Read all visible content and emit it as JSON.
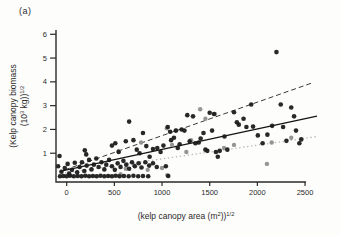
{
  "panel_label": "(a)",
  "chart_data": {
    "type": "scatter",
    "title": "",
    "xlabel_text": "(kelp canopy area (m²))¹⁄²",
    "ylabel_text": "(Kelp canopy biomass (10³ kg))¹⁄²",
    "xlabel_parts": [
      {
        "t": "(kelp canopy area (m"
      },
      {
        "t": "2",
        "sup": true
      },
      {
        "t": "))"
      },
      {
        "t": "1/2",
        "sup": true
      }
    ],
    "ylabel_line1": "(Kelp canopy biomass",
    "ylabel_line2_parts": [
      {
        "t": "(10"
      },
      {
        "t": "3",
        "sup": true
      },
      {
        "t": " kg))"
      },
      {
        "t": "1/2",
        "sup": true
      }
    ],
    "xlim": [
      -112,
      2510
    ],
    "ylim": [
      -0.21,
      6.18
    ],
    "xticks": [
      0,
      500,
      1000,
      1500,
      2000,
      2500
    ],
    "yticks": [
      1,
      2,
      3,
      4,
      5,
      6
    ],
    "grid": false,
    "legend": "none",
    "colors": {
      "dark_points": "#1b1b1b",
      "gray_points": "#8f8f8f",
      "dashed_line": "#3a3a3a",
      "solid_line": "#141414",
      "dotted_line": "#b8b8b8",
      "axis": "#2b2b2b"
    },
    "lines": [
      {
        "name": "dashed-regression",
        "style": "dashed",
        "x1": -20,
        "y1": 0.3,
        "x2": 2570,
        "y2": 3.95
      },
      {
        "name": "solid-regression",
        "style": "solid",
        "x1": -60,
        "y1": 0.25,
        "x2": 2625,
        "y2": 2.56
      },
      {
        "name": "dotted-regression",
        "style": "dotted",
        "x1": -60,
        "y1": 0.15,
        "x2": 2625,
        "y2": 1.7
      }
    ],
    "series": [
      {
        "name": "dark-points",
        "points": [
          [
            -70,
            0.03
          ],
          [
            -35,
            0.04
          ],
          [
            0,
            0.03
          ],
          [
            35,
            0.05
          ],
          [
            75,
            0.03
          ],
          [
            115,
            0.04
          ],
          [
            155,
            0.03
          ],
          [
            195,
            0.05
          ],
          [
            235,
            0.03
          ],
          [
            275,
            0.04
          ],
          [
            315,
            0.03
          ],
          [
            355,
            0.05
          ],
          [
            395,
            0.03
          ],
          [
            435,
            0.04
          ],
          [
            475,
            0.03
          ],
          [
            515,
            0.05
          ],
          [
            555,
            0.03
          ],
          [
            600,
            0.04
          ],
          [
            650,
            0.03
          ],
          [
            700,
            0.05
          ],
          [
            750,
            0.03
          ],
          [
            800,
            0.04
          ],
          [
            855,
            0.03
          ],
          [
            1065,
            0.04
          ],
          [
            -90,
            0.45
          ],
          [
            -55,
            0.22
          ],
          [
            -20,
            0.38
          ],
          [
            10,
            0.55
          ],
          [
            25,
            0.15
          ],
          [
            55,
            0.3
          ],
          [
            85,
            0.6
          ],
          [
            110,
            0.2
          ],
          [
            135,
            0.42
          ],
          [
            160,
            0.62
          ],
          [
            185,
            0.25
          ],
          [
            210,
            0.48
          ],
          [
            235,
            0.72
          ],
          [
            260,
            0.32
          ],
          [
            285,
            0.52
          ],
          [
            310,
            0.78
          ],
          [
            335,
            0.42
          ],
          [
            365,
            0.62
          ],
          [
            395,
            0.32
          ],
          [
            415,
            0.52
          ],
          [
            445,
            0.72
          ],
          [
            475,
            0.45
          ],
          [
            505,
            0.3
          ],
          [
            535,
            0.58
          ],
          [
            565,
            0.42
          ],
          [
            595,
            0.68
          ],
          [
            625,
            0.52
          ],
          [
            655,
            0.35
          ],
          [
            685,
            0.62
          ],
          [
            715,
            0.45
          ],
          [
            755,
            0.58
          ],
          [
            785,
            0.4
          ],
          [
            825,
            0.62
          ],
          [
            865,
            0.48
          ],
          [
            905,
            0.58
          ],
          [
            945,
            0.42
          ],
          [
            -75,
            0.88
          ],
          [
            190,
            1.12
          ],
          [
            205,
            0.95
          ],
          [
            475,
            1.32
          ],
          [
            510,
            1.42
          ],
          [
            545,
            1.05
          ],
          [
            620,
            1.5
          ],
          [
            655,
            2.33
          ],
          [
            700,
            1.55
          ],
          [
            735,
            1.15
          ],
          [
            765,
            1.0
          ],
          [
            800,
            1.85
          ],
          [
            835,
            1.3
          ],
          [
            870,
            0.85
          ],
          [
            905,
            1.18
          ],
          [
            950,
            1.22
          ],
          [
            985,
            1.05
          ],
          [
            1015,
            1.32
          ],
          [
            1040,
            0.45
          ],
          [
            1060,
            2.1
          ],
          [
            1085,
            1.9
          ],
          [
            1095,
            1.55
          ],
          [
            1125,
            1.65
          ],
          [
            1145,
            1.95
          ],
          [
            1165,
            1.22
          ],
          [
            1185,
            1.38
          ],
          [
            1205,
            2.0
          ],
          [
            1235,
            1.95
          ],
          [
            1265,
            2.6
          ],
          [
            1290,
            1.5
          ],
          [
            1325,
            2.55
          ],
          [
            1350,
            1.42
          ],
          [
            1385,
            1.45
          ],
          [
            1405,
            1.62
          ],
          [
            1435,
            1.85
          ],
          [
            1455,
            1.15
          ],
          [
            1475,
            1.1
          ],
          [
            1500,
            2.7
          ],
          [
            1525,
            1.95
          ],
          [
            1545,
            2.65
          ],
          [
            1565,
            1.05
          ],
          [
            1585,
            0.85
          ],
          [
            1605,
            1.1
          ],
          [
            1655,
            1.7
          ],
          [
            1685,
            1.15
          ],
          [
            1755,
            2.72
          ],
          [
            1785,
            2.3
          ],
          [
            1805,
            2.2
          ],
          [
            1855,
            2.45
          ],
          [
            1885,
            2.1
          ],
          [
            1935,
            3.05
          ],
          [
            1955,
            2.12
          ],
          [
            2005,
            1.75
          ],
          [
            2055,
            1.42
          ],
          [
            2105,
            1.78
          ],
          [
            2155,
            2.15
          ],
          [
            2200,
            5.25
          ],
          [
            2245,
            3.05
          ],
          [
            2270,
            2.1
          ],
          [
            2305,
            1.52
          ],
          [
            2355,
            2.92
          ],
          [
            2385,
            2.55
          ],
          [
            2405,
            1.95
          ],
          [
            2440,
            1.42
          ],
          [
            2460,
            1.58
          ]
        ]
      },
      {
        "name": "gray-points",
        "points": [
          [
            545,
            1.1
          ],
          [
            565,
            0.12
          ],
          [
            620,
            0.35
          ],
          [
            705,
            0.5
          ],
          [
            780,
            1.45
          ],
          [
            850,
            0.3
          ],
          [
            1000,
            0.38
          ],
          [
            1050,
            2.05
          ],
          [
            1055,
            0.08
          ],
          [
            1105,
            1.35
          ],
          [
            1150,
            1.95
          ],
          [
            1255,
            1.05
          ],
          [
            1305,
            1.55
          ],
          [
            1400,
            2.85
          ],
          [
            1455,
            2.45
          ],
          [
            1555,
            2.65
          ],
          [
            1650,
            1.22
          ],
          [
            1755,
            1.35
          ],
          [
            2100,
            0.55
          ],
          [
            2150,
            1.45
          ],
          [
            2355,
            1.65
          ]
        ]
      }
    ]
  }
}
